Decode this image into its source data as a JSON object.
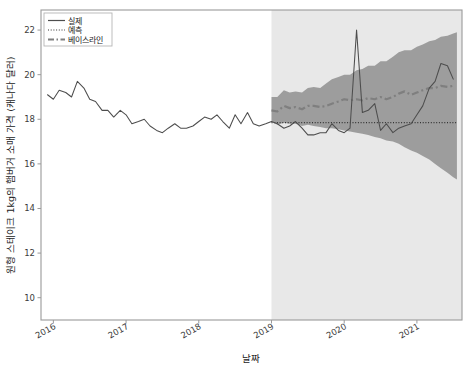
{
  "chart_data": {
    "type": "line",
    "title": "",
    "xlabel": "날짜",
    "ylabel": "원형 스테이크 1kg의 햄버거 소매 가격 (캐나다 달러)",
    "ylim": [
      9.0,
      22.9
    ],
    "yticks": [
      10,
      12,
      14,
      16,
      18,
      20,
      22
    ],
    "ytick_labels": [
      "10",
      "12",
      "14",
      "16",
      "18",
      "20",
      "22"
    ],
    "xlim": [
      2015.83,
      2021.62
    ],
    "xticks": [
      2016,
      2017,
      2018,
      2019,
      2020,
      2021
    ],
    "xtick_labels": [
      "2016",
      "2017",
      "2018",
      "2019",
      "2020",
      "2021"
    ],
    "grid": false,
    "legend_position": "upper left",
    "forecast_start": 2019.0,
    "forecast_shading_color": "#e8e8e8",
    "interval_band_color": "#999999",
    "line_color": "#4d4d4d",
    "baseline_color": "#7f7f7f",
    "forecast_color": "#333333",
    "legend": [
      {
        "label": "실제",
        "style": "solid",
        "color": "#4d4d4d"
      },
      {
        "label": "예측",
        "style": "dotted",
        "color": "#333333"
      },
      {
        "label": "베이스라인",
        "style": "dashdot",
        "color": "#7f7f7f"
      }
    ],
    "series": [
      {
        "name": "실제",
        "style": "solid",
        "x": [
          2015.92,
          2016.0,
          2016.08,
          2016.17,
          2016.25,
          2016.33,
          2016.42,
          2016.5,
          2016.58,
          2016.67,
          2016.75,
          2016.83,
          2016.92,
          2017.0,
          2017.08,
          2017.17,
          2017.25,
          2017.33,
          2017.42,
          2017.5,
          2017.58,
          2017.67,
          2017.75,
          2017.83,
          2017.92,
          2018.0,
          2018.08,
          2018.17,
          2018.25,
          2018.33,
          2018.42,
          2018.5,
          2018.58,
          2018.67,
          2018.75,
          2018.83,
          2018.92,
          2019.0,
          2019.08,
          2019.17,
          2019.25,
          2019.33,
          2019.42,
          2019.5,
          2019.58,
          2019.67,
          2019.75,
          2019.83,
          2019.92,
          2020.0,
          2020.08,
          2020.17,
          2020.25,
          2020.33,
          2020.42,
          2020.5,
          2020.58,
          2020.67,
          2020.75,
          2020.83,
          2020.92,
          2021.0,
          2021.08,
          2021.17,
          2021.25,
          2021.33,
          2021.42,
          2021.5
        ],
        "values": [
          19.1,
          18.9,
          19.3,
          19.2,
          19.0,
          19.7,
          19.4,
          18.9,
          18.8,
          18.4,
          18.4,
          18.1,
          18.4,
          18.2,
          17.8,
          17.9,
          18.0,
          17.7,
          17.5,
          17.4,
          17.6,
          17.8,
          17.6,
          17.6,
          17.7,
          17.9,
          18.1,
          18.0,
          18.2,
          17.9,
          17.6,
          18.2,
          17.8,
          18.3,
          17.8,
          17.7,
          17.8,
          17.9,
          17.8,
          17.6,
          17.7,
          17.9,
          17.6,
          17.3,
          17.3,
          17.4,
          17.4,
          17.8,
          17.5,
          17.4,
          17.6,
          22.0,
          18.3,
          18.4,
          18.7,
          17.5,
          17.8,
          17.4,
          17.6,
          17.7,
          17.8,
          18.2,
          18.6,
          19.4,
          19.7,
          20.5,
          20.4,
          19.8
        ]
      },
      {
        "name": "예측",
        "style": "dotted",
        "x": [
          2019.0,
          2021.55
        ],
        "values": [
          17.85,
          17.85
        ]
      },
      {
        "name": "베이스라인",
        "style": "dashdot",
        "x": [
          2019.0,
          2019.08,
          2019.17,
          2019.25,
          2019.33,
          2019.42,
          2019.5,
          2019.58,
          2019.67,
          2019.75,
          2019.83,
          2019.92,
          2020.0,
          2020.08,
          2020.17,
          2020.25,
          2020.33,
          2020.42,
          2020.5,
          2020.58,
          2020.67,
          2020.75,
          2020.83,
          2020.92,
          2021.0,
          2021.08,
          2021.17,
          2021.25,
          2021.33,
          2021.42,
          2021.5
        ],
        "values": [
          18.4,
          18.35,
          18.6,
          18.5,
          18.55,
          18.45,
          18.6,
          18.6,
          18.55,
          18.6,
          18.7,
          18.8,
          18.9,
          18.85,
          18.9,
          18.85,
          18.95,
          18.9,
          19.0,
          18.9,
          19.0,
          19.15,
          19.25,
          19.1,
          19.2,
          19.3,
          19.4,
          19.4,
          19.5,
          19.45,
          19.5
        ]
      }
    ],
    "interval_band": {
      "name": "예측 구간",
      "x": [
        2019.0,
        2019.08,
        2019.17,
        2019.25,
        2019.33,
        2019.42,
        2019.5,
        2019.58,
        2019.67,
        2019.75,
        2019.83,
        2019.92,
        2020.0,
        2020.08,
        2020.17,
        2020.25,
        2020.33,
        2020.42,
        2020.5,
        2020.58,
        2020.67,
        2020.75,
        2020.83,
        2020.92,
        2021.0,
        2021.08,
        2021.17,
        2021.25,
        2021.33,
        2021.42,
        2021.5,
        2021.55
      ],
      "upper": [
        19.0,
        19.0,
        19.3,
        19.2,
        19.25,
        19.2,
        19.4,
        19.45,
        19.4,
        19.6,
        19.8,
        19.9,
        20.0,
        20.0,
        20.2,
        20.25,
        20.4,
        20.4,
        20.6,
        20.6,
        20.8,
        21.0,
        21.1,
        21.1,
        21.25,
        21.35,
        21.5,
        21.55,
        21.7,
        21.75,
        21.85,
        21.9
      ],
      "lower": [
        17.9,
        17.75,
        17.85,
        17.8,
        17.8,
        17.7,
        17.75,
        17.7,
        17.65,
        17.6,
        17.6,
        17.55,
        17.5,
        17.45,
        17.4,
        17.35,
        17.3,
        17.2,
        17.15,
        17.05,
        17.0,
        16.9,
        16.75,
        16.6,
        16.5,
        16.35,
        16.2,
        16.0,
        15.8,
        15.6,
        15.4,
        15.3
      ]
    }
  },
  "axes": {
    "y_title": "원형 스테이크 1kg의 햄버거 소매 가격 (캐나다 달러)",
    "x_title": "날짜"
  },
  "legend": {
    "items": [
      {
        "label": "실제"
      },
      {
        "label": "예측"
      },
      {
        "label": "베이스라인"
      }
    ]
  }
}
